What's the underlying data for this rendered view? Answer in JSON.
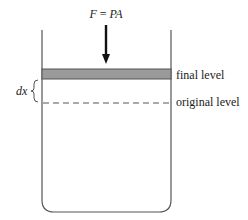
{
  "diagram": {
    "force_label": {
      "lhs": "F",
      "eq": " = ",
      "rhs": "PA"
    },
    "final_level_label": "final level",
    "original_level_label": "original level",
    "displacement_label": "dx",
    "colors": {
      "stroke": "#555555",
      "piston_fill": "#9a9a9a",
      "arrow": "#111111",
      "text": "#222222"
    }
  }
}
